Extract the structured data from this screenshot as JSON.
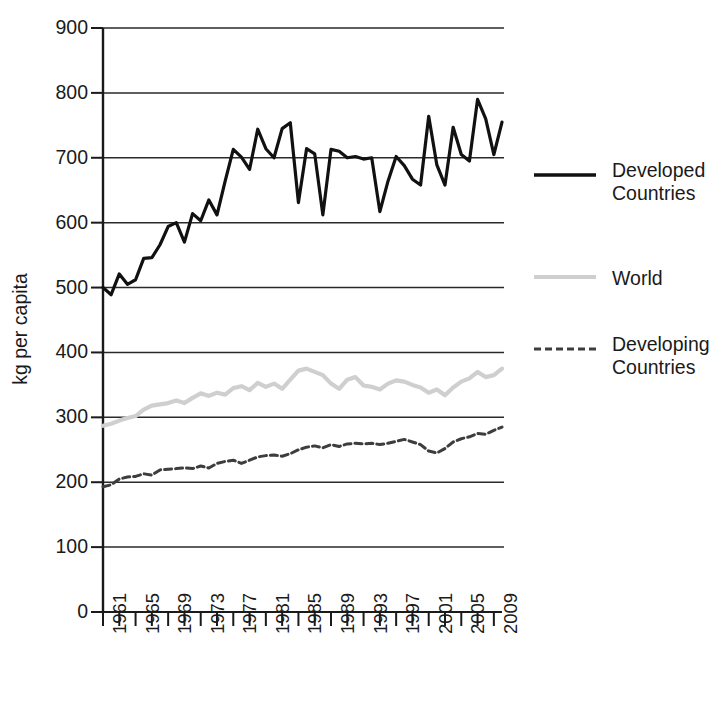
{
  "chart_data": {
    "type": "line",
    "title": "",
    "subtitle": "",
    "xlabel": "",
    "ylabel": "kg per capita",
    "xlim": [
      1961,
      2010
    ],
    "ylim": [
      0,
      900
    ],
    "grid": true,
    "grid_axis": "y",
    "legend_position": "right",
    "y_ticks": [
      0,
      100,
      200,
      300,
      400,
      500,
      600,
      700,
      800,
      900
    ],
    "y_tick_labels": [
      "0",
      "100",
      "200",
      "300",
      "400",
      "500",
      "600",
      "700",
      "800",
      "900"
    ],
    "x_ticks": [
      1961,
      1963,
      1965,
      1967,
      1969,
      1971,
      1973,
      1975,
      1977,
      1979,
      1981,
      1983,
      1985,
      1987,
      1989,
      1991,
      1993,
      1995,
      1997,
      1999,
      2001,
      2003,
      2005,
      2007,
      2009
    ],
    "x_tick_labels": [
      "1961",
      "1965",
      "1969",
      "1973",
      "1977",
      "1981",
      "1985",
      "1989",
      "1993",
      "1997",
      "2001",
      "2005",
      "2009"
    ],
    "x_tick_labels_years": [
      1961,
      1965,
      1969,
      1973,
      1977,
      1981,
      1985,
      1989,
      1993,
      1997,
      2001,
      2005,
      2009
    ],
    "x": [
      1961,
      1962,
      1963,
      1964,
      1965,
      1966,
      1967,
      1968,
      1969,
      1970,
      1971,
      1972,
      1973,
      1974,
      1975,
      1976,
      1977,
      1978,
      1979,
      1980,
      1981,
      1982,
      1983,
      1984,
      1985,
      1986,
      1987,
      1988,
      1989,
      1990,
      1991,
      1992,
      1993,
      1994,
      1995,
      1996,
      1997,
      1998,
      1999,
      2000,
      2001,
      2002,
      2003,
      2004,
      2005,
      2006,
      2007,
      2008,
      2009,
      2010
    ],
    "series": [
      {
        "name": "Developed Countries",
        "color": "#111111",
        "style": "solid",
        "width": 3.2,
        "values": [
          500,
          489,
          521,
          505,
          512,
          545,
          546,
          566,
          594,
          600,
          570,
          614,
          603,
          635,
          612,
          664,
          713,
          701,
          682,
          744,
          714,
          700,
          745,
          754,
          631,
          714,
          706,
          612,
          713,
          710,
          700,
          702,
          698,
          700,
          617,
          664,
          702,
          688,
          667,
          658,
          764,
          689,
          658,
          747,
          705,
          695,
          790,
          760,
          705,
          755
        ]
      },
      {
        "name": "World",
        "color": "#cfcfcf",
        "style": "solid",
        "width": 4.2,
        "values": [
          287,
          290,
          295,
          299,
          302,
          312,
          318,
          320,
          322,
          326,
          322,
          330,
          337,
          333,
          338,
          335,
          345,
          348,
          342,
          353,
          347,
          352,
          344,
          358,
          372,
          375,
          370,
          365,
          352,
          344,
          358,
          362,
          349,
          347,
          343,
          352,
          357,
          355,
          350,
          346,
          338,
          343,
          334,
          346,
          355,
          360,
          370,
          362,
          365,
          375
        ]
      },
      {
        "name": "Developing Countries",
        "color": "#3d3d3d",
        "style": "dashed",
        "width": 3.0,
        "values": [
          193,
          196,
          205,
          208,
          209,
          213,
          211,
          219,
          220,
          221,
          222,
          221,
          225,
          222,
          229,
          232,
          234,
          229,
          234,
          239,
          241,
          242,
          240,
          244,
          250,
          254,
          256,
          253,
          258,
          255,
          259,
          260,
          259,
          260,
          258,
          260,
          263,
          266,
          262,
          258,
          248,
          245,
          252,
          262,
          267,
          270,
          275,
          274,
          280,
          285
        ]
      }
    ]
  },
  "axis": {
    "y_title": "kg per capita"
  },
  "legend": {
    "items": [
      {
        "label": "Developed\nCountries",
        "style": "solid",
        "color": "#111111"
      },
      {
        "label": "World",
        "style": "solid",
        "color": "#cfcfcf"
      },
      {
        "label": "Developing\nCountries",
        "style": "dashed",
        "color": "#3d3d3d"
      }
    ]
  }
}
